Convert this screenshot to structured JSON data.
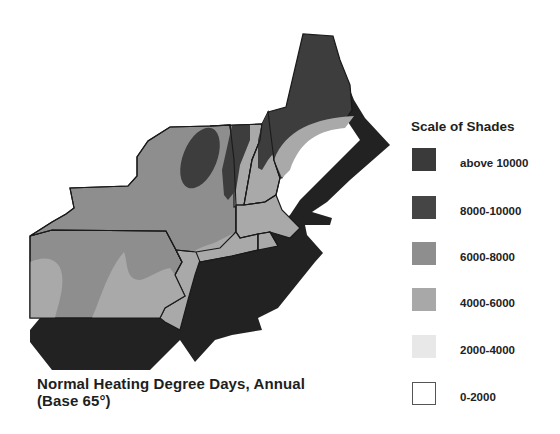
{
  "caption": {
    "line1": "Normal Heating Degree Days, Annual",
    "line2": "(Base 65°)"
  },
  "legend": {
    "title": "Scale of Shades",
    "items": [
      {
        "label": "above 10000",
        "color": "#3a3a3a"
      },
      {
        "label": "8000-10000",
        "color": "#454545"
      },
      {
        "label": "6000-8000",
        "color": "#8e8e8e"
      },
      {
        "label": "4000-6000",
        "color": "#a8a8a8"
      },
      {
        "label": "2000-4000",
        "color": "#e8e8e8"
      },
      {
        "label": "0-2000",
        "color": "#ffffff"
      }
    ]
  },
  "map": {
    "region": "Northeastern United States",
    "colors": {
      "extrusion": "#222222",
      "dark": "#3d3d3d",
      "mid": "#8e8e8e",
      "light": "#a9a9a9",
      "border": "#1a1a1a"
    }
  }
}
